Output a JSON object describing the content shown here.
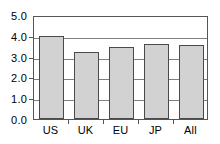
{
  "chart_data": {
    "type": "bar",
    "title": "",
    "subtitle": "",
    "xlabel": "",
    "ylabel": "",
    "categories": [
      "US",
      "UK",
      "EU",
      "JP",
      "All"
    ],
    "values": [
      4.0,
      3.2,
      3.45,
      3.63,
      3.54
    ],
    "series": [
      {
        "name": "",
        "values": [
          4.0,
          3.2,
          3.45,
          3.63,
          3.54
        ]
      }
    ],
    "ylim": [
      0.0,
      5.0
    ],
    "ytick_labels": [
      "0.0",
      "1.0",
      "2.0",
      "3.0",
      "4.0",
      "5.0"
    ],
    "ytick_values": [
      0.0,
      1.0,
      2.0,
      3.0,
      4.0,
      5.0
    ],
    "xtick_labels": [
      "US",
      "UK",
      "EU",
      "JP",
      "All"
    ],
    "grid": "horizontal",
    "legend": "none",
    "annotations": [],
    "colors": {
      "bar_fill": "#d2d2d2",
      "bar_edge": "#4a4a4a",
      "gridline": "#808080",
      "axis": "#555555",
      "text": "#000000",
      "background": "#ffffff"
    }
  }
}
